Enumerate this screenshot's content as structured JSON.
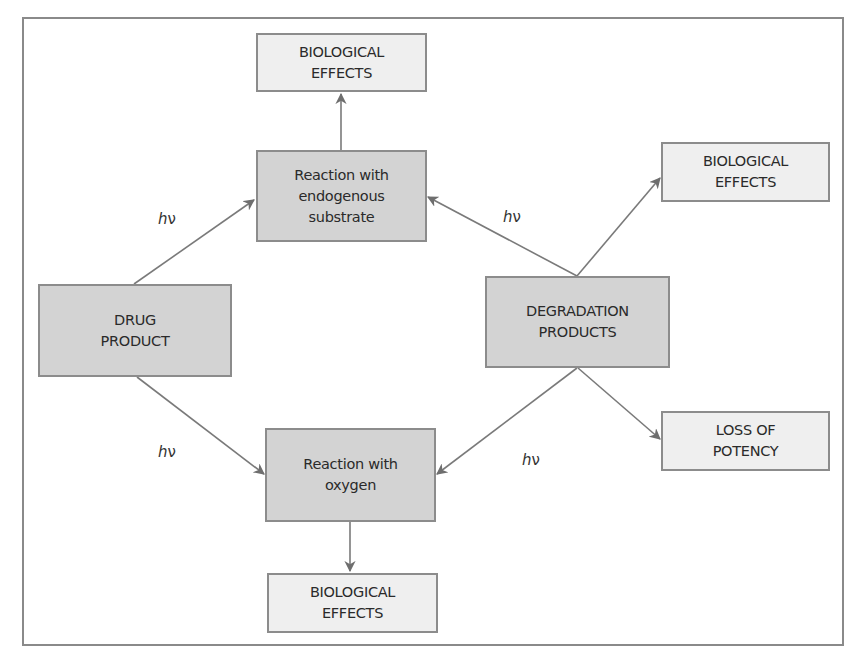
{
  "diagram": {
    "nodes": {
      "bio_top": {
        "label": "BIOLOGICAL\nEFFECTS"
      },
      "reaction_endogenous": {
        "label": "Reaction with\nendogenous\nsubstrate"
      },
      "drug_product": {
        "label": "DRUG\nPRODUCT"
      },
      "degradation_products": {
        "label": "DEGRADATION\nPRODUCTS"
      },
      "bio_right": {
        "label": "BIOLOGICAL\nEFFECTS"
      },
      "loss_of_potency": {
        "label": "LOSS OF\nPOTENCY"
      },
      "reaction_oxygen": {
        "label": "Reaction with\noxygen"
      },
      "bio_bottom": {
        "label": "BIOLOGICAL\nEFFECTS"
      }
    },
    "edge_labels": {
      "drug_to_endogenous": {
        "h": "h",
        "nu": "ν"
      },
      "degradation_to_endogenous": {
        "h": "h",
        "nu": "ν"
      },
      "drug_to_oxygen": {
        "h": "h",
        "nu": "ν"
      },
      "degradation_to_oxygen": {
        "h": "h",
        "nu": "ν"
      }
    },
    "edges": [
      {
        "from": "reaction_endogenous",
        "to": "bio_top"
      },
      {
        "from": "drug_product",
        "to": "reaction_endogenous",
        "label": "hν"
      },
      {
        "from": "degradation_products",
        "to": "reaction_endogenous",
        "label": "hν"
      },
      {
        "from": "degradation_products",
        "to": "bio_right"
      },
      {
        "from": "drug_product",
        "to": "reaction_oxygen",
        "label": "hν"
      },
      {
        "from": "degradation_products",
        "to": "reaction_oxygen",
        "label": "hν"
      },
      {
        "from": "degradation_products",
        "to": "loss_of_potency"
      },
      {
        "from": "reaction_oxygen",
        "to": "bio_bottom"
      }
    ],
    "colors": {
      "dark_fill": "#d3d3d3",
      "light_fill": "#efefef",
      "stroke": "#8c8c8c",
      "arrow": "#6e6e6e"
    }
  }
}
